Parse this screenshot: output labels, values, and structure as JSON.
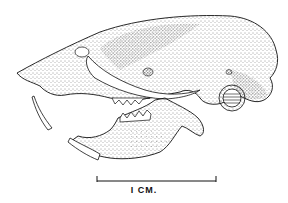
{
  "figure": {
    "style": "stippled pen-and-ink illustration",
    "ink_color": "#111111",
    "background_color": "#ffffff"
  },
  "scale_bar": {
    "label": "I CM.",
    "x1": 97,
    "x2": 216,
    "y": 181
  }
}
